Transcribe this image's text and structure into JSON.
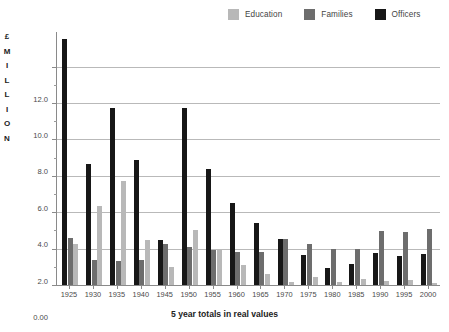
{
  "chart_data": {
    "type": "bar",
    "title": "",
    "xlabel": "5 year totals in real values",
    "ylabel": "£ MILLION",
    "ylabel_letters": [
      "£",
      "M",
      "I",
      "L",
      "L",
      "I",
      "O",
      "N"
    ],
    "categories": [
      "1925",
      "1930",
      "1935",
      "1940",
      "1945",
      "1950",
      "1955",
      "1960",
      "1965",
      "1970",
      "1975",
      "1980",
      "1985",
      "1990",
      "1995",
      "2000"
    ],
    "ylim": [
      0,
      13.9
    ],
    "yticks": [
      0,
      2.0,
      4.0,
      6.0,
      8.0,
      10.0,
      12.0
    ],
    "ytick_labels": [
      "0.00",
      "2.0",
      "4.0",
      "6.0",
      "8.0",
      "10.0",
      "12.0"
    ],
    "grid": true,
    "legend_position": "top-right",
    "series": [
      {
        "name": "Officers",
        "color": "#171717",
        "values": [
          13.5,
          6.65,
          9.75,
          6.85,
          2.45,
          9.75,
          6.4,
          4.5,
          3.4,
          2.55,
          1.65,
          0.95,
          1.15,
          1.75,
          1.6,
          1.7
        ]
      },
      {
        "name": "Families",
        "color": "#6d6d6d",
        "values": [
          2.6,
          1.4,
          1.3,
          1.4,
          2.25,
          2.1,
          1.9,
          1.8,
          1.8,
          2.55,
          2.25,
          2.0,
          2.0,
          2.95,
          2.9,
          3.1
        ]
      },
      {
        "name": "Education",
        "color": "#b8b8b8",
        "values": [
          2.25,
          4.35,
          5.7,
          2.5,
          1.0,
          3.05,
          1.95,
          1.1,
          0.6,
          0.15,
          0.45,
          0.15,
          0.35,
          0.2,
          0.3,
          0.1
        ]
      }
    ]
  },
  "legend": {
    "items": [
      {
        "label": "Education",
        "color": "#b8b8b8"
      },
      {
        "label": "Families",
        "color": "#6d6d6d"
      },
      {
        "label": "Officers",
        "color": "#171717"
      }
    ]
  }
}
